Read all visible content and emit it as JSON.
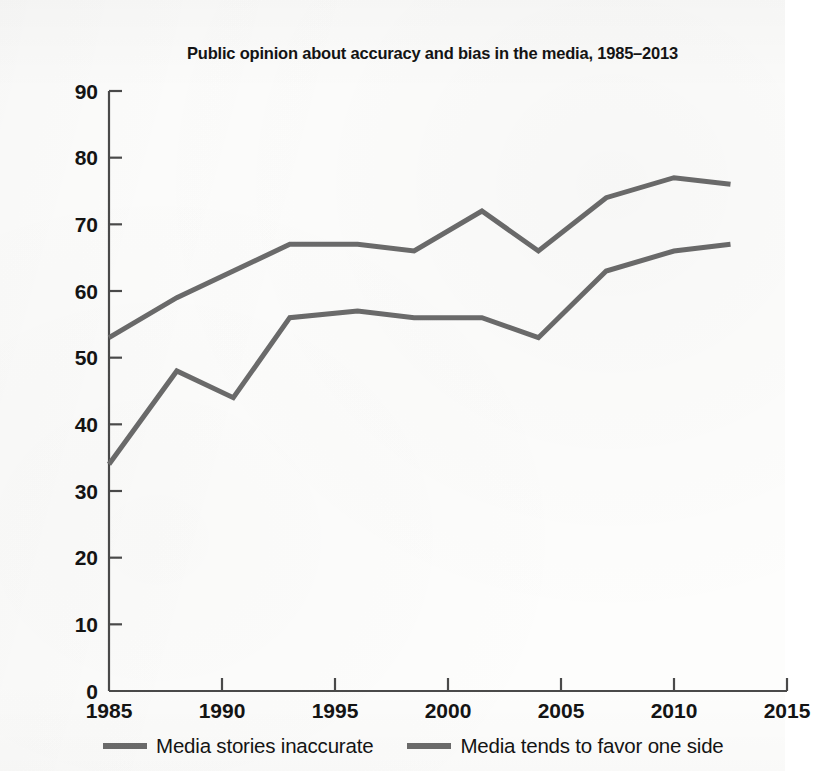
{
  "chart_data": {
    "type": "line",
    "title": "Public opinion about accuracy and bias in the media, 1985–2013",
    "xlabel": "",
    "ylabel": "",
    "xlim": [
      1985,
      2015
    ],
    "ylim": [
      0,
      90
    ],
    "xticks": [
      1985,
      1990,
      1995,
      2000,
      2005,
      2010,
      2015
    ],
    "xtick_labels": [
      "1985",
      "1990",
      "1995",
      "2000",
      "2005",
      "2010",
      "2015"
    ],
    "yticks": [
      0,
      10,
      20,
      30,
      40,
      50,
      60,
      70,
      80,
      90
    ],
    "ytick_labels": [
      "0",
      "10",
      "20",
      "30",
      "40",
      "50",
      "60",
      "70",
      "80",
      "90"
    ],
    "grid": false,
    "legend_position": "below",
    "series": [
      {
        "name": "Media stories inaccurate",
        "color": "#6b6b6b",
        "x": [
          1985,
          1988,
          1990.5,
          1993,
          1996,
          1998.5,
          2001.5,
          2004,
          2007,
          2010,
          2012.5
        ],
        "values": [
          53,
          59,
          63,
          67,
          67,
          66,
          72,
          66,
          74,
          77,
          76
        ]
      },
      {
        "name": "Media tends to favor one side",
        "color": "#6b6b6b",
        "x": [
          1985,
          1988,
          1990.5,
          1993,
          1996,
          1998.5,
          2001.5,
          2004,
          2007,
          2010,
          2012.5
        ],
        "values": [
          34,
          48,
          44,
          56,
          57,
          56,
          56,
          53,
          63,
          66,
          67
        ]
      }
    ]
  },
  "legend": {
    "items": [
      {
        "label": "Media stories inaccurate",
        "color": "#6b6b6b"
      },
      {
        "label": "Media tends to favor one side",
        "color": "#6b6b6b"
      }
    ]
  },
  "colors": {
    "line": "#6b6b6b",
    "axis": "#4a4a4a",
    "text": "#141414",
    "background": "#fdfdfc"
  }
}
